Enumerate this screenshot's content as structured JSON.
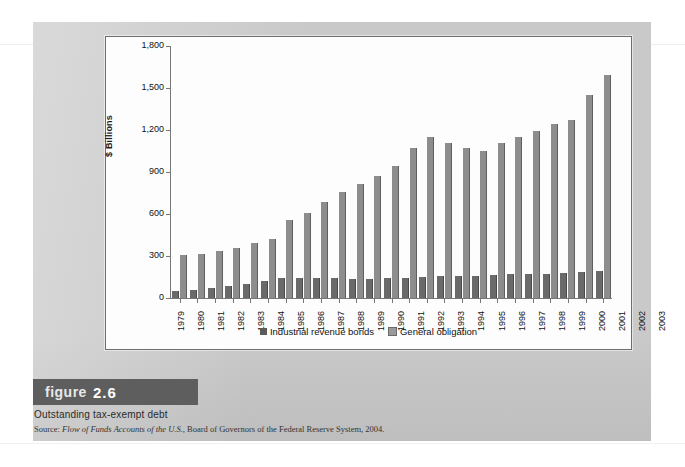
{
  "figure": {
    "tag_word": "figure",
    "number": "2.6",
    "caption": "Outstanding tax-exempt debt",
    "source_prefix": "Source: ",
    "source_italic": "Flow of Funds Accounts of the U.S.",
    "source_rest": ", Board of Governors of the Federal Reserve System, 2004."
  },
  "colors": {
    "page": "#c9c9c9",
    "panel": "#fdfdfd",
    "industrial_revenue_bonds": "#6a6a6a",
    "general_obligation": "#8d8d8d",
    "figure_tag_bg": "#5e5e5e"
  },
  "ghost_text": [
    "can be purchased by investors",
    "the tax-exempt bond market",
    "Municipal bonds",
    "yields are lower than on",
    "issued by state and local"
  ],
  "chart_data": {
    "type": "bar",
    "title": "Outstanding tax-exempt debt",
    "xlabel": "",
    "ylabel": "$ Billions",
    "ylim": [
      0,
      1800
    ],
    "yticks": [
      0,
      300,
      600,
      900,
      1200,
      1500,
      1800
    ],
    "ytick_labels": [
      "0",
      "300",
      "600",
      "900",
      "1,200",
      "1,500",
      "1,800"
    ],
    "grid": false,
    "legend_position": "bottom",
    "categories": [
      "1979",
      "1980",
      "1981",
      "1982",
      "1983",
      "1984",
      "1985",
      "1986",
      "1987",
      "1988",
      "1989",
      "1990",
      "1991",
      "1992",
      "1993",
      "1994",
      "1995",
      "1996",
      "1997",
      "1998",
      "1999",
      "2000",
      "2001",
      "2002",
      "2003"
    ],
    "series": [
      {
        "name": "Industrial revenue bonds",
        "color": "#6a6a6a",
        "values": [
          50,
          60,
          70,
          85,
          100,
          118,
          145,
          140,
          140,
          140,
          138,
          135,
          140,
          145,
          150,
          155,
          160,
          155,
          165,
          170,
          175,
          175,
          180,
          185,
          190
        ]
      },
      {
        "name": "General obligation",
        "color": "#8d8d8d",
        "values": [
          305,
          315,
          335,
          360,
          395,
          425,
          560,
          610,
          685,
          755,
          815,
          870,
          945,
          1070,
          1150,
          1110,
          1075,
          1050,
          1105,
          1150,
          1195,
          1245,
          1275,
          1450,
          1590
        ]
      }
    ]
  }
}
